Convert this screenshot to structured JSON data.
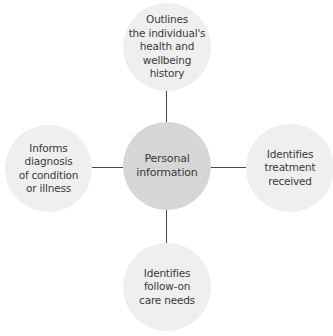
{
  "diagram": {
    "type": "hub-and-spoke",
    "center": {
      "label": "Personal\ninformation"
    },
    "spokes": [
      {
        "position": "top",
        "label": "Outlines\nthe individual's\nhealth and\nwellbeing\nhistory"
      },
      {
        "position": "right",
        "label": "Identifies\ntreatment\nreceived"
      },
      {
        "position": "bottom",
        "label": "Identifies\nfollow-on\ncare needs"
      },
      {
        "position": "left",
        "label": "Informs\ndiagnosis\nof condition\nor illness"
      }
    ],
    "colors": {
      "center_fill": "#d6d6d6",
      "spoke_fill": "#efefef",
      "connector": "#4a4a4a",
      "text": "#3a3a3a"
    }
  }
}
